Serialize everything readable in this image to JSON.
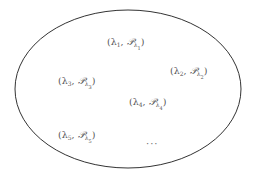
{
  "diagram": {
    "type": "set-ellipse",
    "stroke_color": "#333333",
    "text_color": "#555555",
    "ellipse": {
      "cx": 128,
      "cy": 89,
      "rx": 113,
      "ry": 79
    },
    "elements": [
      {
        "id": 1,
        "lambda": "λ",
        "index": "1",
        "script": "𝒫",
        "label": "(λ1, 𝒫λ1)",
        "x": 107,
        "y": 37
      },
      {
        "id": 2,
        "lambda": "λ",
        "index": "2",
        "script": "𝒫",
        "label": "(λ2, 𝒫λ2)",
        "x": 170,
        "y": 66
      },
      {
        "id": 3,
        "lambda": "λ",
        "index": "3",
        "script": "𝒫",
        "label": "(λ3, 𝒫λ3)",
        "x": 58,
        "y": 76
      },
      {
        "id": 4,
        "lambda": "λ",
        "index": "4",
        "script": "𝒫",
        "label": "(λ4, 𝒫λ4)",
        "x": 129,
        "y": 97
      },
      {
        "id": 5,
        "lambda": "λ",
        "index": "5",
        "script": "𝒫",
        "label": "(λ5, 𝒫λ5)",
        "x": 58,
        "y": 130
      }
    ],
    "ellipsis": {
      "text": "···",
      "x": 146,
      "y": 138
    }
  }
}
